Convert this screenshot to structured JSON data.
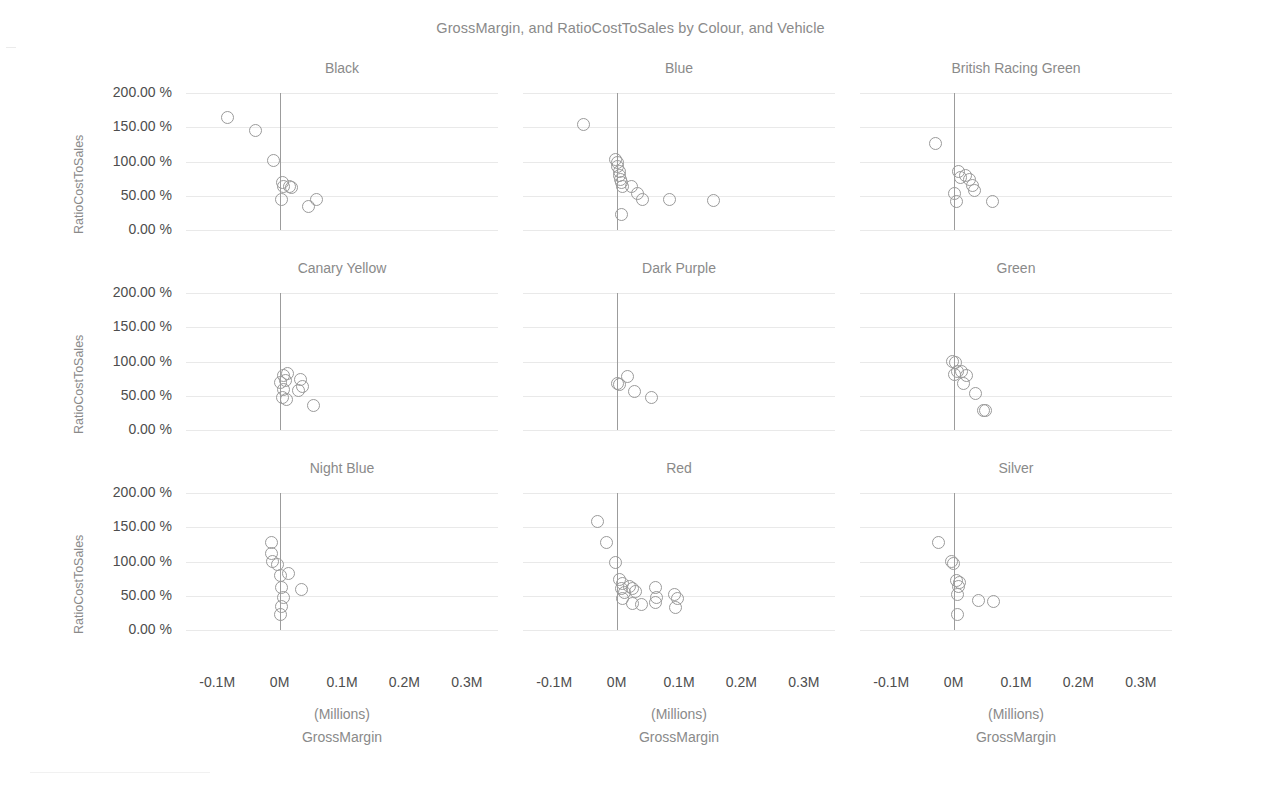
{
  "chart_data": {
    "type": "scatter",
    "title": "GrossMargin, and RatioCostToSales by Colour, and Vehicle",
    "xlabel": "GrossMargin",
    "xunit": "(Millions)",
    "ylabel": "RatioCostToSales",
    "xlim": [
      -0.15,
      0.35
    ],
    "ylim": [
      0,
      2.2
    ],
    "xticks": [
      "-0.1M",
      "0M",
      "0.1M",
      "0.2M",
      "0.3M"
    ],
    "xtick_values": [
      -0.1,
      0,
      0.1,
      0.2,
      0.3
    ],
    "yticks": [
      "0.00 %",
      "50.00 %",
      "100.00 %",
      "150.00 %",
      "200.00 %"
    ],
    "ytick_values": [
      0,
      50,
      100,
      150,
      200
    ],
    "grid": true,
    "legend": "none",
    "facet_by": "Colour",
    "marker": "open-circle",
    "marker_color": "#9a9a9a",
    "panels": [
      {
        "name": "Black",
        "row": 0,
        "col": 0,
        "points": [
          {
            "x": -0.083,
            "y": 164
          },
          {
            "x": -0.038,
            "y": 145
          },
          {
            "x": -0.009,
            "y": 101
          },
          {
            "x": 0.004,
            "y": 69
          },
          {
            "x": 0.006,
            "y": 63
          },
          {
            "x": 0.016,
            "y": 64
          },
          {
            "x": 0.019,
            "y": 62
          },
          {
            "x": 0.003,
            "y": 44
          },
          {
            "x": 0.046,
            "y": 35
          },
          {
            "x": 0.059,
            "y": 45
          }
        ]
      },
      {
        "name": "Blue",
        "row": 0,
        "col": 1,
        "points": [
          {
            "x": -0.053,
            "y": 154
          },
          {
            "x": -0.002,
            "y": 103
          },
          {
            "x": 0.001,
            "y": 98
          },
          {
            "x": 0.002,
            "y": 93
          },
          {
            "x": 0.004,
            "y": 86
          },
          {
            "x": 0.005,
            "y": 80
          },
          {
            "x": 0.007,
            "y": 74
          },
          {
            "x": 0.008,
            "y": 69
          },
          {
            "x": 0.009,
            "y": 64
          },
          {
            "x": 0.024,
            "y": 63
          },
          {
            "x": 0.033,
            "y": 53
          },
          {
            "x": 0.042,
            "y": 44
          },
          {
            "x": 0.008,
            "y": 22
          },
          {
            "x": 0.085,
            "y": 44
          },
          {
            "x": 0.155,
            "y": 43
          }
        ]
      },
      {
        "name": "British Racing Green",
        "row": 0,
        "col": 2,
        "points": [
          {
            "x": -0.029,
            "y": 127
          },
          {
            "x": 0.008,
            "y": 85
          },
          {
            "x": 0.011,
            "y": 76
          },
          {
            "x": 0.019,
            "y": 80
          },
          {
            "x": 0.026,
            "y": 73
          },
          {
            "x": 0.031,
            "y": 65
          },
          {
            "x": 0.034,
            "y": 57
          },
          {
            "x": 0.002,
            "y": 54
          },
          {
            "x": 0.005,
            "y": 41
          },
          {
            "x": 0.062,
            "y": 42
          }
        ]
      },
      {
        "name": "Canary Yellow",
        "row": 1,
        "col": 0,
        "points": [
          {
            "x": 0.006,
            "y": 80
          },
          {
            "x": 0.012,
            "y": 83
          },
          {
            "x": 0.001,
            "y": 70
          },
          {
            "x": 0.009,
            "y": 72
          },
          {
            "x": 0.007,
            "y": 59
          },
          {
            "x": 0.005,
            "y": 48
          },
          {
            "x": 0.011,
            "y": 45
          },
          {
            "x": 0.034,
            "y": 74
          },
          {
            "x": 0.037,
            "y": 63
          },
          {
            "x": 0.031,
            "y": 57
          },
          {
            "x": 0.055,
            "y": 36
          }
        ]
      },
      {
        "name": "Dark Purple",
        "row": 1,
        "col": 1,
        "points": [
          {
            "x": 0.001,
            "y": 68
          },
          {
            "x": 0.004,
            "y": 66
          },
          {
            "x": 0.017,
            "y": 78
          },
          {
            "x": 0.028,
            "y": 56
          },
          {
            "x": 0.056,
            "y": 47
          }
        ]
      },
      {
        "name": "Green",
        "row": 1,
        "col": 2,
        "points": [
          {
            "x": -0.001,
            "y": 100
          },
          {
            "x": 0.003,
            "y": 98
          },
          {
            "x": 0.006,
            "y": 85
          },
          {
            "x": 0.002,
            "y": 81
          },
          {
            "x": 0.013,
            "y": 86
          },
          {
            "x": 0.021,
            "y": 80
          },
          {
            "x": 0.016,
            "y": 68
          },
          {
            "x": 0.035,
            "y": 53
          },
          {
            "x": 0.048,
            "y": 29
          },
          {
            "x": 0.051,
            "y": 28
          }
        ]
      },
      {
        "name": "Night Blue",
        "row": 2,
        "col": 0,
        "points": [
          {
            "x": -0.013,
            "y": 128
          },
          {
            "x": -0.013,
            "y": 112
          },
          {
            "x": -0.011,
            "y": 100
          },
          {
            "x": -0.003,
            "y": 95
          },
          {
            "x": 0.002,
            "y": 79
          },
          {
            "x": 0.014,
            "y": 82
          },
          {
            "x": 0.003,
            "y": 62
          },
          {
            "x": 0.006,
            "y": 47
          },
          {
            "x": 0.003,
            "y": 35
          },
          {
            "x": 0.001,
            "y": 22
          },
          {
            "x": 0.035,
            "y": 59
          }
        ]
      },
      {
        "name": "Red",
        "row": 2,
        "col": 1,
        "points": [
          {
            "x": -0.03,
            "y": 158
          },
          {
            "x": -0.016,
            "y": 128
          },
          {
            "x": -0.002,
            "y": 98
          },
          {
            "x": 0.004,
            "y": 73
          },
          {
            "x": 0.01,
            "y": 68
          },
          {
            "x": 0.008,
            "y": 60
          },
          {
            "x": 0.012,
            "y": 55
          },
          {
            "x": 0.01,
            "y": 46
          },
          {
            "x": 0.021,
            "y": 63
          },
          {
            "x": 0.026,
            "y": 60
          },
          {
            "x": 0.031,
            "y": 56
          },
          {
            "x": 0.025,
            "y": 39
          },
          {
            "x": 0.04,
            "y": 37
          },
          {
            "x": 0.062,
            "y": 62
          },
          {
            "x": 0.064,
            "y": 48
          },
          {
            "x": 0.063,
            "y": 40
          },
          {
            "x": 0.092,
            "y": 52
          },
          {
            "x": 0.097,
            "y": 46
          },
          {
            "x": 0.094,
            "y": 33
          }
        ]
      },
      {
        "name": "Silver",
        "row": 2,
        "col": 2,
        "points": [
          {
            "x": -0.025,
            "y": 128
          },
          {
            "x": -0.003,
            "y": 100
          },
          {
            "x": 0.0,
            "y": 97
          },
          {
            "x": 0.004,
            "y": 72
          },
          {
            "x": 0.01,
            "y": 70
          },
          {
            "x": 0.008,
            "y": 63
          },
          {
            "x": 0.007,
            "y": 52
          },
          {
            "x": 0.006,
            "y": 22
          },
          {
            "x": 0.04,
            "y": 43
          },
          {
            "x": 0.064,
            "y": 41
          }
        ]
      }
    ]
  }
}
